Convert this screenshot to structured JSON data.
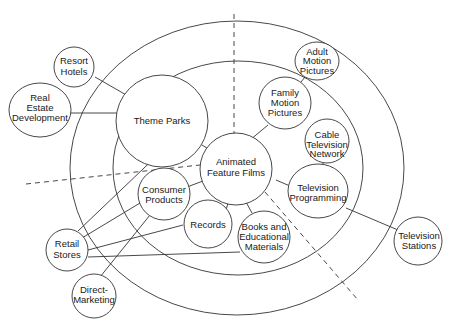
{
  "diagram": {
    "center": {
      "id": "animated",
      "lines": [
        "Animated",
        "Feature Films"
      ]
    },
    "nodes": [
      {
        "id": "resort",
        "lines": [
          "Resort",
          "Hotels"
        ]
      },
      {
        "id": "realestate",
        "lines": [
          "Real",
          "Estate",
          "Development"
        ]
      },
      {
        "id": "themeparks",
        "lines": [
          "Theme Parks"
        ]
      },
      {
        "id": "adult",
        "lines": [
          "Adult",
          "Motion",
          "Pictures"
        ]
      },
      {
        "id": "family",
        "lines": [
          "Family",
          "Motion",
          "Pictures"
        ]
      },
      {
        "id": "cable",
        "lines": [
          "Cable",
          "Television",
          "Network"
        ]
      },
      {
        "id": "tvprog",
        "lines": [
          "Television",
          "Programming"
        ]
      },
      {
        "id": "tvstations",
        "lines": [
          "Television",
          "Stations"
        ]
      },
      {
        "id": "consumer",
        "lines": [
          "Consumer",
          "Products"
        ]
      },
      {
        "id": "records",
        "lines": [
          "Records"
        ]
      },
      {
        "id": "books",
        "lines": [
          "Books and",
          "Educational",
          "Materials"
        ]
      },
      {
        "id": "retail",
        "lines": [
          "Retail",
          "Stores"
        ]
      },
      {
        "id": "direct",
        "lines": [
          "Direct-",
          "Marketing"
        ]
      }
    ],
    "edges": [
      [
        "resort",
        "themeparks"
      ],
      [
        "realestate",
        "themeparks"
      ],
      [
        "themeparks",
        "animated"
      ],
      [
        "family",
        "animated"
      ],
      [
        "adult",
        "family"
      ],
      [
        "cable",
        "tvprog"
      ],
      [
        "tvprog",
        "animated"
      ],
      [
        "tvprog",
        "tvstations"
      ],
      [
        "consumer",
        "animated"
      ],
      [
        "records",
        "animated"
      ],
      [
        "books",
        "animated"
      ],
      [
        "retail",
        "themeparks"
      ],
      [
        "retail",
        "consumer"
      ],
      [
        "retail",
        "records"
      ],
      [
        "retail",
        "books"
      ],
      [
        "direct",
        "consumer"
      ]
    ],
    "rings": [
      "inner ring",
      "outer ring"
    ],
    "dividers": [
      "vertical top divider",
      "left divider",
      "lower-right divider"
    ]
  }
}
